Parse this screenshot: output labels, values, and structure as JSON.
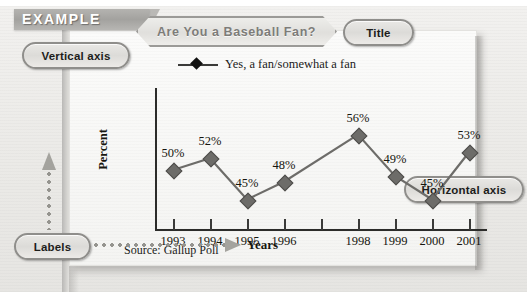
{
  "banner": {
    "label": "EXAMPLE"
  },
  "callouts": {
    "vertical_axis": "Vertical axis",
    "horizontal_axis": "Horizontal axis",
    "title": "Title",
    "labels": "Labels"
  },
  "source_note": "Source: Gallup Poll",
  "chart_data": {
    "type": "line",
    "title": "Are You a Baseball Fan?",
    "xlabel": "Years",
    "ylabel": "Percent",
    "legend": [
      {
        "name": "Yes, a fan/somewhat a fan",
        "marker": "diamond",
        "color": "#6d6c69"
      }
    ],
    "legend_position": "top-center",
    "grid": false,
    "axis_ticks": [
      "1993",
      "1994",
      "1995",
      "1996",
      "",
      "1998",
      "1999",
      "2000",
      "2001"
    ],
    "categories": [
      "1993",
      "1994",
      "1995",
      "1996",
      "1998",
      "1999",
      "2000",
      "2001"
    ],
    "values": [
      50,
      52,
      45,
      48,
      56,
      49,
      45,
      53
    ],
    "value_labels": [
      "50%",
      "52%",
      "45%",
      "48%",
      "56%",
      "49%",
      "45%",
      "53%"
    ],
    "ylim": [
      40,
      60
    ],
    "note": "No data point plotted for 1997; tick mark present without label."
  }
}
